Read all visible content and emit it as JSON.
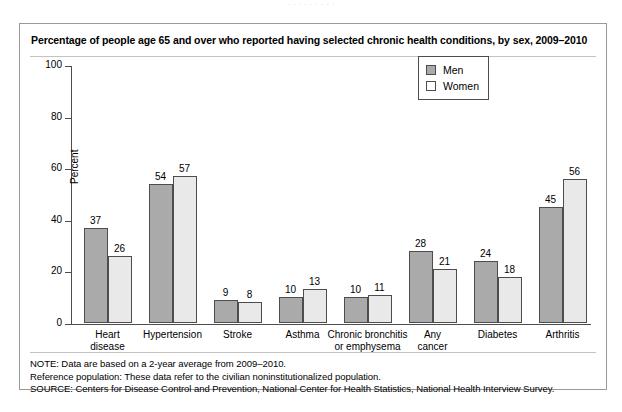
{
  "top_cut_text": "·  ·   ·    ·            ·  ·  ·      ·      ·",
  "panel": {
    "title": "Percentage of people age 65 and over who reported having selected chronic health conditions, by sex, 2009–2010"
  },
  "legend": {
    "items": [
      {
        "label": "Men",
        "color": "#aaaaaa"
      },
      {
        "label": "Women",
        "color": "#ffffff"
      }
    ]
  },
  "footer": {
    "lines": [
      "NOTE: Data are based on a 2-year average from 2009–2010.",
      "Reference population: These data refer to the civilian noninstitutionalized population.",
      "SOURCE: Centers for Disease Control and Prevention, National Center for Health Statistics, National Health Interview Survey."
    ]
  },
  "chart_data": {
    "type": "bar",
    "title": "Percentage of people age 65 and over who reported having selected chronic health conditions, by sex, 2009–2010",
    "xlabel": "",
    "ylabel": "Percent",
    "ylim": [
      0,
      100
    ],
    "yticks": [
      0,
      20,
      40,
      60,
      80,
      100
    ],
    "ytick_labels": [
      "0",
      "20",
      "40",
      "60",
      "80",
      "100"
    ],
    "grid": false,
    "legend_position": "top-right",
    "categories": [
      "Heart disease",
      "Hypertension",
      "Stroke",
      "Asthma",
      "Chronic bronchitis or emphysema",
      "Any cancer",
      "Diabetes",
      "Arthritis"
    ],
    "category_lines": [
      [
        "Heart",
        "disease"
      ],
      [
        "Hypertension"
      ],
      [
        "Stroke"
      ],
      [
        "Asthma"
      ],
      [
        "Chronic bronchitis",
        "or emphysema"
      ],
      [
        "Any",
        "cancer"
      ],
      [
        "Diabetes"
      ],
      [
        "Arthritis"
      ]
    ],
    "series": [
      {
        "name": "Men",
        "color": "#aaaaaa",
        "values": [
          37,
          54,
          9,
          10,
          10,
          28,
          24,
          45
        ]
      },
      {
        "name": "Women",
        "color": "#e9e9e9",
        "values": [
          26,
          57,
          8,
          13,
          11,
          21,
          18,
          56
        ]
      }
    ]
  }
}
